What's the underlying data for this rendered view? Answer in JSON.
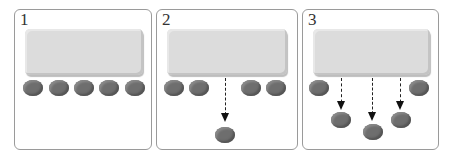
{
  "panels": [
    {
      "label": "1",
      "description": "Five coins in a row under the box"
    },
    {
      "label": "2",
      "description": "Middle coin drops below"
    },
    {
      "label": "3",
      "description": "Three middle coins drop below"
    }
  ],
  "colors": {
    "box": "#dcdcdc",
    "coin": "#6e6e6e",
    "border": "#9a9a9a",
    "arrow": "#222222"
  }
}
